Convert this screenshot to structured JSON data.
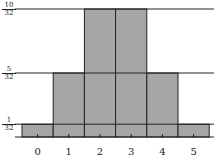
{
  "chart_data": {
    "type": "bar",
    "title": "",
    "xlabel": "",
    "ylabel": "",
    "categories": [
      "0",
      "1",
      "2",
      "3",
      "4",
      "5"
    ],
    "values": [
      0.03125,
      0.15625,
      0.3125,
      0.3125,
      0.15625,
      0.03125
    ],
    "value_labels": [
      "1/32",
      "5/32",
      "10/32",
      "10/32",
      "5/32",
      "1/32"
    ],
    "ylim": [
      0,
      0.3125
    ],
    "y_ticks": [
      {
        "num": "1",
        "den": "32",
        "value": 0.03125
      },
      {
        "num": "5",
        "den": "32",
        "value": 0.15625
      },
      {
        "num": "10",
        "den": "32",
        "value": 0.3125
      }
    ],
    "grid": "horizontal lines at y tick values",
    "bar_color": "#a6a6a6",
    "edge_color": "#222222",
    "legend": null
  }
}
